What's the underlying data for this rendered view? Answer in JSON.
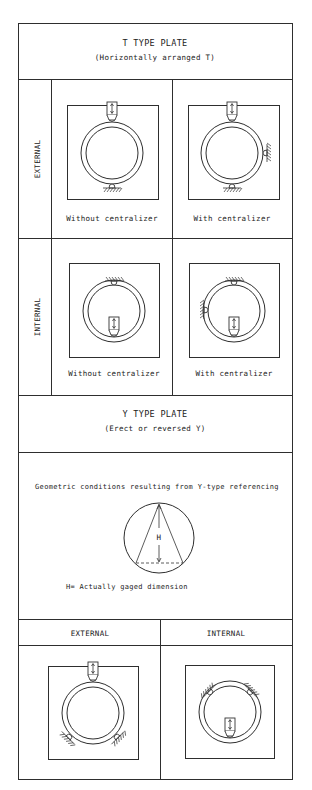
{
  "t_plate": {
    "title": "T TYPE PLATE",
    "subtitle": "(Horizontally arranged T)",
    "rows": [
      {
        "label": "EXTERNAL",
        "cells": [
          {
            "caption": "Without centralizer"
          },
          {
            "caption": "With centralizer"
          }
        ]
      },
      {
        "label": "INTERNAL",
        "cells": [
          {
            "caption": "Without centralizer"
          },
          {
            "caption": "With centralizer"
          }
        ]
      }
    ]
  },
  "y_plate": {
    "title": "Y TYPE PLATE",
    "subtitle": "(Erect or reversed Y)",
    "geometry": {
      "caption": "Geometric conditions resulting from Y-type referencing",
      "dimension_symbol": "H",
      "legend": "H= Actually gaged dimension"
    },
    "columns": [
      {
        "label": "EXTERNAL"
      },
      {
        "label": "INTERNAL"
      }
    ]
  },
  "colors": {
    "line": "#2e2e2e",
    "background": "#ffffff",
    "text": "#222222"
  }
}
